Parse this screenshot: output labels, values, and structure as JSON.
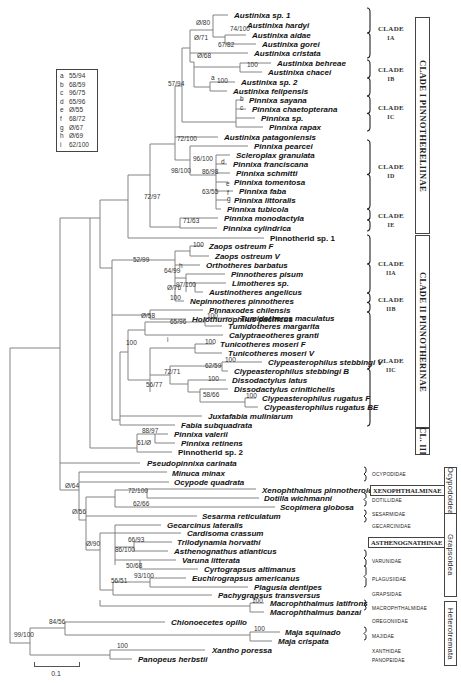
{
  "figure": {
    "type": "phylogenetic-tree",
    "scale_bar": {
      "label": "0.1"
    }
  },
  "legend": {
    "items": [
      {
        "key": "a",
        "value": "55/94"
      },
      {
        "key": "b",
        "value": "68/59"
      },
      {
        "key": "c",
        "value": "96/75"
      },
      {
        "key": "d",
        "value": "65/96"
      },
      {
        "key": "e",
        "value": "Ø/55"
      },
      {
        "key": "f",
        "value": "68/72"
      },
      {
        "key": "g",
        "value": "Ø/67"
      },
      {
        "key": "h",
        "value": "Ø/69"
      },
      {
        "key": "i",
        "value": "62/100"
      }
    ]
  },
  "taxa": [
    {
      "name": "Austinixa sp. 1",
      "x": 232,
      "y": 15
    },
    {
      "name": "Austinixa hardyi",
      "x": 245,
      "y": 25
    },
    {
      "name": "Austinixa aidae",
      "x": 250,
      "y": 35
    },
    {
      "name": "Austinixa gorei",
      "x": 260,
      "y": 44
    },
    {
      "name": "Austinixa cristata",
      "x": 252,
      "y": 53
    },
    {
      "name": "Austinixa behreae",
      "x": 275,
      "y": 63
    },
    {
      "name": "Austinixa chacei",
      "x": 266,
      "y": 72
    },
    {
      "name": "Austinixa sp. 2",
      "x": 239,
      "y": 82
    },
    {
      "name": "Austinixa felipensis",
      "x": 231,
      "y": 91
    },
    {
      "name": "Pinnixa sayana",
      "x": 247,
      "y": 100
    },
    {
      "name": "Pinnixa chaetopterana",
      "x": 250,
      "y": 109
    },
    {
      "name": "Pinnixa sp.",
      "x": 259,
      "y": 118
    },
    {
      "name": "Pinnixa rapax",
      "x": 267,
      "y": 127
    },
    {
      "name": "Austinixa patagoniensis",
      "x": 222,
      "y": 137
    },
    {
      "name": "Pinnixa pearcei",
      "x": 252,
      "y": 146
    },
    {
      "name": "Scleroplax granulata",
      "x": 234,
      "y": 155
    },
    {
      "name": "Pinnixa franciscana",
      "x": 231,
      "y": 164
    },
    {
      "name": "Pinnixa schmitti",
      "x": 234,
      "y": 173
    },
    {
      "name": "Pinnixa tomentosa",
      "x": 232,
      "y": 182
    },
    {
      "name": "Pinnixa faba",
      "x": 237,
      "y": 191
    },
    {
      "name": "Pinnixa littoralis",
      "x": 232,
      "y": 200
    },
    {
      "name": "Pinnixa tubicola",
      "x": 225,
      "y": 209
    },
    {
      "name": "Pinnixa monodactyla",
      "x": 222,
      "y": 218
    },
    {
      "name": "Pinnixa cylindrica",
      "x": 221,
      "y": 228
    },
    {
      "name": "Pinnotherid sp. 1",
      "x": 268,
      "y": 238,
      "plain": true
    },
    {
      "name": "Zaops ostreum F",
      "x": 207,
      "y": 246
    },
    {
      "name": "Zaops ostreum V",
      "x": 213,
      "y": 256
    },
    {
      "name": "Orthotheres barbatus",
      "x": 204,
      "y": 265
    },
    {
      "name": "Pinnotheres pisum",
      "x": 229,
      "y": 274
    },
    {
      "name": "Limotheres sp.",
      "x": 230,
      "y": 283
    },
    {
      "name": "Austinotheres angelicus",
      "x": 207,
      "y": 292
    },
    {
      "name": "Nepinnotheres pinnotheres",
      "x": 188,
      "y": 301
    },
    {
      "name": "Pinnaxodes chilensis",
      "x": 207,
      "y": 310
    },
    {
      "name": "Holothuriophilus pacificus",
      "x": 190,
      "y": 319
    },
    {
      "name": "Tumidotheres maculatus",
      "x": 238,
      "y": 318
    },
    {
      "name": "Tumidotheres margarita",
      "x": 226,
      "y": 326
    },
    {
      "name": "Calyptraeotheres granti",
      "x": 227,
      "y": 335
    },
    {
      "name": "Tunicotheres moseri F",
      "x": 218,
      "y": 344
    },
    {
      "name": "Tunicotheres moseri V",
      "x": 226,
      "y": 353
    },
    {
      "name": "Clypeasterophilus stebbingi V",
      "x": 266,
      "y": 362
    },
    {
      "name": "Clypeasterophilus stebbingi B",
      "x": 232,
      "y": 371
    },
    {
      "name": "Dissodactylus latus",
      "x": 230,
      "y": 380
    },
    {
      "name": "Dissodactylus crinitichelis",
      "x": 232,
      "y": 389
    },
    {
      "name": "Clypeasterophilus rugatus F",
      "x": 260,
      "y": 398
    },
    {
      "name": "Clypeasterophilus rugatus BE",
      "x": 262,
      "y": 407
    },
    {
      "name": "Juxtafabia muliniarum",
      "x": 206,
      "y": 416
    },
    {
      "name": "Fabia subquadrata",
      "x": 179,
      "y": 425
    },
    {
      "name": "Pinnixa valerii",
      "x": 172,
      "y": 434
    },
    {
      "name": "Pinnixa retinens",
      "x": 179,
      "y": 443
    },
    {
      "name": "Pinnotherid sp. 2",
      "x": 176,
      "y": 452,
      "plain": true
    },
    {
      "name": "Pseudopinnixa carinata",
      "x": 145,
      "y": 463
    },
    {
      "name": "Minuca minax",
      "x": 170,
      "y": 473
    },
    {
      "name": "Ocypode quadrata",
      "x": 172,
      "y": 482
    },
    {
      "name": "Xenophthalmus pinnotheroides",
      "x": 260,
      "y": 490
    },
    {
      "name": "Dotilla wichmanni",
      "x": 262,
      "y": 498
    },
    {
      "name": "Scopimera globosa",
      "x": 278,
      "y": 507
    },
    {
      "name": "Sesarma reticulatum",
      "x": 200,
      "y": 516
    },
    {
      "name": "Gecarcinus lateralis",
      "x": 165,
      "y": 525
    },
    {
      "name": "Cardisoma crassum",
      "x": 185,
      "y": 533
    },
    {
      "name": "Trilodynamia horvathi",
      "x": 175,
      "y": 542
    },
    {
      "name": "Asthenognathus atlanticus",
      "x": 172,
      "y": 551
    },
    {
      "name": "Varuna litterata",
      "x": 180,
      "y": 560
    },
    {
      "name": "Cyrtograpsus altimanus",
      "x": 202,
      "y": 569
    },
    {
      "name": "Euchirograpsus americanus",
      "x": 190,
      "y": 578
    },
    {
      "name": "Plagusia dentipes",
      "x": 252,
      "y": 587
    },
    {
      "name": "Pachygrapsus transversus",
      "x": 216,
      "y": 595
    },
    {
      "name": "Macrophthalmus latifrons",
      "x": 268,
      "y": 603
    },
    {
      "name": "Macrophthalmus banzai",
      "x": 268,
      "y": 612
    },
    {
      "name": "Chionoecetes opilio",
      "x": 169,
      "y": 622
    },
    {
      "name": "Maja squinado",
      "x": 283,
      "y": 632
    },
    {
      "name": "Maja crispata",
      "x": 276,
      "y": 641
    },
    {
      "name": "Xantho poressa",
      "x": 210,
      "y": 650
    },
    {
      "name": "Panopeus herbstii",
      "x": 136,
      "y": 659
    }
  ],
  "support_values": [
    {
      "label": "Ø/80",
      "x": 196,
      "y": 25
    },
    {
      "label": "74/100",
      "x": 230,
      "y": 31
    },
    {
      "label": "Ø/71",
      "x": 194,
      "y": 40
    },
    {
      "label": "67/82",
      "x": 218,
      "y": 47
    },
    {
      "label": "Ø/68",
      "x": 197,
      "y": 58
    },
    {
      "label": "100",
      "x": 247,
      "y": 67
    },
    {
      "label": "57/94",
      "x": 168,
      "y": 86
    },
    {
      "label": "a",
      "x": 211,
      "y": 80
    },
    {
      "label": "100",
      "x": 217,
      "y": 83
    },
    {
      "label": "b",
      "x": 240,
      "y": 101
    },
    {
      "label": "c",
      "x": 240,
      "y": 110
    },
    {
      "label": "72/100",
      "x": 177,
      "y": 141
    },
    {
      "label": "96/100",
      "x": 193,
      "y": 161
    },
    {
      "label": "d",
      "x": 221,
      "y": 164
    },
    {
      "label": "98/100",
      "x": 171,
      "y": 173
    },
    {
      "label": "86/98",
      "x": 202,
      "y": 174
    },
    {
      "label": "e",
      "x": 226,
      "y": 186
    },
    {
      "label": "63/55",
      "x": 202,
      "y": 194
    },
    {
      "label": "f",
      "x": 227,
      "y": 195
    },
    {
      "label": "g",
      "x": 227,
      "y": 201
    },
    {
      "label": "72/97",
      "x": 144,
      "y": 199
    },
    {
      "label": "71/63",
      "x": 183,
      "y": 223
    },
    {
      "label": "100",
      "x": 193,
      "y": 247
    },
    {
      "label": "52/99",
      "x": 133,
      "y": 262
    },
    {
      "label": "h",
      "x": 179,
      "y": 268
    },
    {
      "label": "64/99",
      "x": 164,
      "y": 273
    },
    {
      "label": "97/100",
      "x": 176,
      "y": 287
    },
    {
      "label": "Ø/76",
      "x": 167,
      "y": 290
    },
    {
      "label": "100",
      "x": 170,
      "y": 300
    },
    {
      "label": "Ø/58",
      "x": 141,
      "y": 318
    },
    {
      "label": "100",
      "x": 207,
      "y": 318
    },
    {
      "label": "65/96",
      "x": 170,
      "y": 324
    },
    {
      "label": "100",
      "x": 126,
      "y": 345
    },
    {
      "label": "i",
      "x": 167,
      "y": 342
    },
    {
      "label": "100",
      "x": 205,
      "y": 344
    },
    {
      "label": "100",
      "x": 225,
      "y": 362
    },
    {
      "label": "62/59",
      "x": 205,
      "y": 368
    },
    {
      "label": "72/71",
      "x": 164,
      "y": 374
    },
    {
      "label": "100",
      "x": 208,
      "y": 381
    },
    {
      "label": "56/77",
      "x": 146,
      "y": 387
    },
    {
      "label": "58/66",
      "x": 203,
      "y": 397
    },
    {
      "label": "100",
      "x": 246,
      "y": 398
    },
    {
      "label": "88/97",
      "x": 142,
      "y": 433
    },
    {
      "label": "61/Ø",
      "x": 137,
      "y": 445
    },
    {
      "label": "Ø/64",
      "x": 65,
      "y": 488
    },
    {
      "label": "72/100",
      "x": 128,
      "y": 493
    },
    {
      "label": "62/66",
      "x": 133,
      "y": 506
    },
    {
      "label": "Ø/56",
      "x": 72,
      "y": 514
    },
    {
      "label": "Ø/90",
      "x": 86,
      "y": 546
    },
    {
      "label": "66/93",
      "x": 128,
      "y": 542
    },
    {
      "label": "86/100",
      "x": 115,
      "y": 552
    },
    {
      "label": "50/68",
      "x": 126,
      "y": 568
    },
    {
      "label": "93/100",
      "x": 134,
      "y": 578
    },
    {
      "label": "56/51",
      "x": 111,
      "y": 583
    },
    {
      "label": "100",
      "x": 252,
      "y": 603
    },
    {
      "label": "84/56",
      "x": 49,
      "y": 624
    },
    {
      "label": "99/100",
      "x": 14,
      "y": 637
    },
    {
      "label": "100",
      "x": 254,
      "y": 631
    },
    {
      "label": "100",
      "x": 117,
      "y": 648
    }
  ],
  "clades": [
    {
      "label": "CLADE",
      "sub": "IA",
      "top": 8,
      "bottom": 58,
      "text_y": 25
    },
    {
      "label": "CLADE",
      "sub": "IB",
      "top": 60,
      "bottom": 96,
      "text_y": 66
    },
    {
      "label": "CLADE",
      "sub": "IC",
      "top": 96,
      "bottom": 131,
      "text_y": 104
    },
    {
      "label": "CLADE",
      "sub": "ID",
      "top": 140,
      "bottom": 209,
      "text_y": 163
    },
    {
      "label": "CLADE",
      "sub": "IE",
      "top": 209,
      "bottom": 231,
      "text_y": 212
    },
    {
      "label": "CLADE",
      "sub": "IIA",
      "top": 235,
      "bottom": 293,
      "text_y": 260
    },
    {
      "label": "CLADE",
      "sub": "IIB",
      "top": 293,
      "bottom": 312,
      "text_y": 296
    },
    {
      "label": "CLADE",
      "sub": "IIC",
      "top": 312,
      "bottom": 426,
      "text_y": 357
    }
  ],
  "major_clades": [
    {
      "label": "CLADE I PINNOTHERELIINAE",
      "top": 17,
      "bottom": 233
    },
    {
      "label": "CLADE II PINNOTHERINAE",
      "top": 235,
      "bottom": 427
    },
    {
      "label": "CL. III",
      "top": 427,
      "bottom": 453
    }
  ],
  "families": [
    {
      "label": "OCYPODIDAE",
      "y": 475
    },
    {
      "label": "DOTILLIDAE",
      "y": 499
    },
    {
      "label": "SESARMIDAE",
      "y": 514
    },
    {
      "label": "GECARCINIDAE",
      "y": 525
    },
    {
      "label": "VARUNIDAE",
      "y": 559
    },
    {
      "label": "PLAGUSIIDAE",
      "y": 577
    },
    {
      "label": "GRAPSIDAE",
      "y": 592
    },
    {
      "label": "MACROPHTHALMIDAE",
      "y": 606
    },
    {
      "label": "OREGONIIDAE",
      "y": 619
    },
    {
      "label": "MAJIDAE",
      "y": 634
    },
    {
      "label": "XANTHIDAE",
      "y": 649
    },
    {
      "label": "PANOPEIDAE",
      "y": 658
    }
  ],
  "subfamilies": [
    {
      "label": "XENOPHTHALMINAE",
      "y": 485
    },
    {
      "label": "ASTHENOGNATHINAE",
      "y": 540
    }
  ],
  "superfamilies": [
    {
      "label": "Ocypodoidea",
      "top": 467,
      "bottom": 513
    },
    {
      "label": "Grapsoidea",
      "top": 513,
      "bottom": 594
    },
    {
      "label": "Heterotremata",
      "top": 601,
      "bottom": 664
    }
  ]
}
